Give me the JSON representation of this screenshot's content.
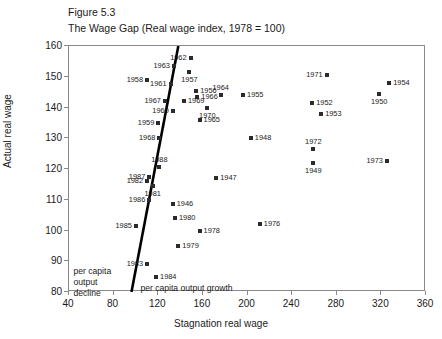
{
  "caption": {
    "figure_number": "Figure 5.3",
    "title": "The Wage Gap (Real wage index, 1978 = 100)"
  },
  "axes": {
    "xlabel": "Stagnation real wage",
    "ylabel": "Actual real wage",
    "xticks": [
      "40",
      "80",
      "120",
      "160",
      "200",
      "240",
      "280",
      "320",
      "360"
    ],
    "yticks": [
      "80",
      "90",
      "100",
      "110",
      "120",
      "130",
      "140",
      "150",
      "160"
    ]
  },
  "annotations": {
    "decline_line1": "per capita",
    "decline_line2": "output",
    "decline_line3": "decline",
    "growth": "per capita output growth"
  },
  "chart_data": {
    "type": "scatter",
    "title": "The Wage Gap (Real wage index, 1978 = 100)",
    "xlabel": "Stagnation real wage",
    "ylabel": "Actual real wage",
    "xlim": [
      40,
      360
    ],
    "ylim": [
      80,
      160
    ],
    "grid": false,
    "legend": null,
    "point_color": "#2b2b2b",
    "trend_line": {
      "label": "per capita output growth/decline divider",
      "x_start": 96,
      "y_start": 80,
      "x_end": 138,
      "y_end": 160,
      "color": "#000000",
      "width_px": 2.6
    },
    "points": [
      {
        "label": "1962",
        "x": 149,
        "y": 156.0,
        "lpos": "l"
      },
      {
        "label": "1963",
        "x": 134,
        "y": 153.5,
        "lpos": "l"
      },
      {
        "label": "1957",
        "x": 148,
        "y": 151.5,
        "lpos": "b"
      },
      {
        "label": "1958",
        "x": 110,
        "y": 149.0,
        "lpos": "l"
      },
      {
        "label": "1961",
        "x": 131,
        "y": 147.5,
        "lpos": "l"
      },
      {
        "label": "1971",
        "x": 271,
        "y": 150.5,
        "lpos": "l"
      },
      {
        "label": "1954",
        "x": 327,
        "y": 148.0,
        "lpos": "r"
      },
      {
        "label": "1950",
        "x": 318,
        "y": 144.5,
        "lpos": "b"
      },
      {
        "label": "1956",
        "x": 154,
        "y": 145.5,
        "lpos": "r"
      },
      {
        "label": "1966",
        "x": 155,
        "y": 143.5,
        "lpos": "r"
      },
      {
        "label": "1964",
        "x": 176,
        "y": 144.0,
        "lpos": "t"
      },
      {
        "label": "1955",
        "x": 196,
        "y": 144.0,
        "lpos": "r"
      },
      {
        "label": "1967",
        "x": 126,
        "y": 142.0,
        "lpos": "l"
      },
      {
        "label": "1969",
        "x": 143,
        "y": 142.0,
        "lpos": "r"
      },
      {
        "label": "1952",
        "x": 258,
        "y": 141.5,
        "lpos": "r"
      },
      {
        "label": "1953",
        "x": 266,
        "y": 138.0,
        "lpos": "r"
      },
      {
        "label": "1960",
        "x": 133,
        "y": 139.0,
        "lpos": "l"
      },
      {
        "label": "1970",
        "x": 164,
        "y": 140.0,
        "lpos": "b"
      },
      {
        "label": "1959",
        "x": 120,
        "y": 135.0,
        "lpos": "l"
      },
      {
        "label": "1965",
        "x": 157,
        "y": 136.0,
        "lpos": "r"
      },
      {
        "label": "1968",
        "x": 121,
        "y": 130.0,
        "lpos": "l"
      },
      {
        "label": "1948",
        "x": 203,
        "y": 130.0,
        "lpos": "r"
      },
      {
        "label": "1972",
        "x": 259,
        "y": 126.5,
        "lpos": "t"
      },
      {
        "label": "1949",
        "x": 259,
        "y": 122.0,
        "lpos": "b"
      },
      {
        "label": "1973",
        "x": 325,
        "y": 122.5,
        "lpos": "l"
      },
      {
        "label": "1988",
        "x": 121,
        "y": 120.5,
        "lpos": "t"
      },
      {
        "label": "1987",
        "x": 112,
        "y": 117.5,
        "lpos": "l"
      },
      {
        "label": "1982",
        "x": 110,
        "y": 116.0,
        "lpos": "l"
      },
      {
        "label": "1981",
        "x": 115,
        "y": 114.5,
        "lpos": "b"
      },
      {
        "label": "1947",
        "x": 172,
        "y": 117.0,
        "lpos": "r"
      },
      {
        "label": "1986",
        "x": 112,
        "y": 110.0,
        "lpos": "l"
      },
      {
        "label": "1946",
        "x": 133,
        "y": 108.5,
        "lpos": "r"
      },
      {
        "label": "1980",
        "x": 135,
        "y": 104.0,
        "lpos": "r"
      },
      {
        "label": "1985",
        "x": 100,
        "y": 101.5,
        "lpos": "l"
      },
      {
        "label": "1976",
        "x": 211,
        "y": 102.0,
        "lpos": "r"
      },
      {
        "label": "1978",
        "x": 157,
        "y": 100.0,
        "lpos": "r"
      },
      {
        "label": "1979",
        "x": 138,
        "y": 95.0,
        "lpos": "r"
      },
      {
        "label": "1983",
        "x": 110,
        "y": 89.0,
        "lpos": "l"
      },
      {
        "label": "1984",
        "x": 118,
        "y": 85.0,
        "lpos": "r"
      }
    ]
  }
}
